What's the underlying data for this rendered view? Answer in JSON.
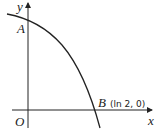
{
  "diagram": {
    "axes": {
      "x_label": "x",
      "y_label": "y",
      "origin_label": "O"
    },
    "points": {
      "A": {
        "label": "A"
      },
      "B": {
        "label": "B",
        "coords": "(ln 2, 0)"
      }
    },
    "colors": {
      "line": "#222222",
      "background": "#ffffff"
    }
  }
}
